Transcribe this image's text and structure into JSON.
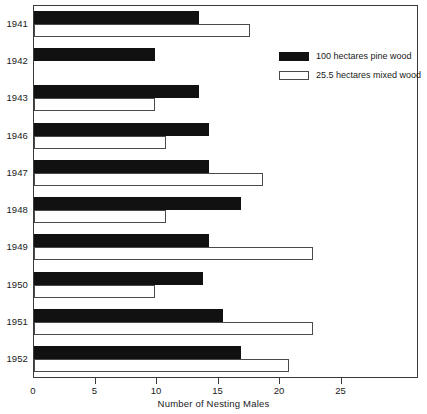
{
  "chart_data": {
    "type": "bar",
    "orientation": "horizontal",
    "title": "",
    "xlabel": "Number of Nesting Males",
    "ylabel": "",
    "categories": [
      "1941",
      "1942",
      "1943",
      "1946",
      "1947",
      "1948",
      "1949",
      "1950",
      "1951",
      "1952"
    ],
    "series": [
      {
        "name": "100 hectares pine wood",
        "color": "#111111",
        "values": [
          13.4,
          9.8,
          13.4,
          14.2,
          14.2,
          16.8,
          14.2,
          13.7,
          15.4,
          16.8
        ]
      },
      {
        "name": "25.5 hectares mixed wood",
        "color": "#ffffff",
        "values": [
          17.6,
          0,
          9.8,
          10.7,
          18.6,
          10.7,
          22.7,
          9.8,
          22.7,
          20.7
        ]
      }
    ],
    "xlim": [
      0,
      31.3
    ],
    "xticks": [
      0,
      5,
      10,
      15,
      20,
      25
    ],
    "xtick_labels": [
      "0",
      "5",
      "10",
      "15",
      "20",
      "25"
    ],
    "grid": false,
    "legend_position": "upper right"
  },
  "legend": {
    "entries": [
      {
        "label": "100 hectares pine wood",
        "swatch": "dark"
      },
      {
        "label": "25.5 hectares mixed wood",
        "swatch": "light"
      }
    ]
  },
  "axis": {
    "x_title": "Number of Nesting Males"
  }
}
